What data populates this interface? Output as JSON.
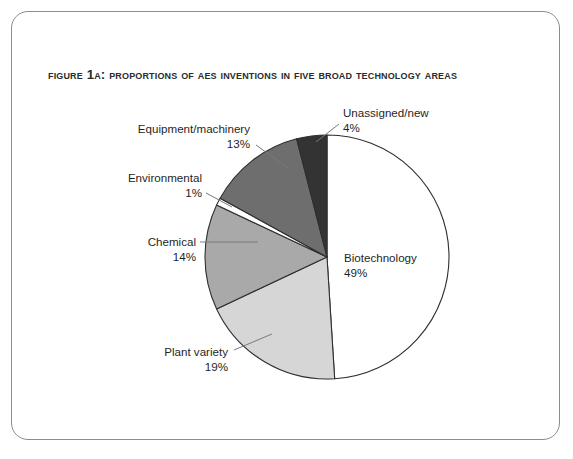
{
  "figure": {
    "title": "Figure 1a: Proportions of AES Inventions in Five Broad Technology Areas",
    "frame_color": "#8c8c8c",
    "background": "#ffffff"
  },
  "chart_data": {
    "type": "pie",
    "title": "Figure 1a: Proportions of AES Inventions in Five Broad Technology Areas",
    "xlabel": "",
    "ylabel": "",
    "legend": "none",
    "value_unit": "%",
    "start_angle_deg": 0,
    "direction": "clockwise",
    "categories": [
      "Biotechnology",
      "Plant variety",
      "Chemical",
      "Environmental",
      "Equipment/machinery",
      "Unassigned/new"
    ],
    "values": [
      49,
      19,
      14,
      1,
      13,
      4
    ],
    "colors": [
      "#ffffff",
      "#d6d6d6",
      "#a9a9a9",
      "#ffffff",
      "#6e6e6e",
      "#333333"
    ],
    "slices": [
      {
        "label": "Biotechnology",
        "value": 49,
        "value_text": "49%",
        "color": "#ffffff",
        "label_x": 344,
        "label_y": 262,
        "pct_x": 344,
        "pct_y": 277,
        "anchor": "start",
        "has_leader": false,
        "leader": ""
      },
      {
        "label": "Plant variety",
        "value": 19,
        "value_text": "19%",
        "color": "#d6d6d6",
        "label_x": 228,
        "label_y": 356,
        "pct_x": 228,
        "pct_y": 371,
        "anchor": "end",
        "has_leader": true,
        "leader": "M234,350 L272,334"
      },
      {
        "label": "Chemical",
        "value": 14,
        "value_text": "14%",
        "color": "#a9a9a9",
        "label_x": 196,
        "label_y": 246,
        "pct_x": 196,
        "pct_y": 261,
        "anchor": "end",
        "has_leader": true,
        "leader": "M200,242 L258,242"
      },
      {
        "label": "Environmental",
        "value": 1,
        "value_text": "1%",
        "color": "#ffffff",
        "label_x": 202,
        "label_y": 182,
        "pct_x": 202,
        "pct_y": 197,
        "anchor": "end",
        "has_leader": true,
        "leader": "M206,193 L232,207"
      },
      {
        "label": "Equipment/machinery",
        "value": 13,
        "value_text": "13%",
        "color": "#6e6e6e",
        "label_x": 250,
        "label_y": 133,
        "pct_x": 250,
        "pct_y": 148,
        "anchor": "end",
        "has_leader": true,
        "leader": "M256,145 L288,168"
      },
      {
        "label": "Unassigned/new",
        "value": 4,
        "value_text": "4%",
        "color": "#333333",
        "label_x": 343,
        "label_y": 117,
        "pct_x": 343,
        "pct_y": 132,
        "anchor": "start",
        "has_leader": true,
        "leader": "M339,124 L316,142"
      }
    ],
    "geometry": {
      "cx": 327,
      "cy": 257,
      "r": 122
    }
  }
}
